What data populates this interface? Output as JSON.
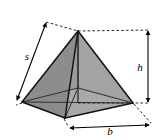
{
  "figure": {
    "name": "square-pyramid",
    "caption": "",
    "canvas": {
      "width": 165,
      "height": 140
    },
    "background_color": "#ffffff"
  },
  "labels": {
    "slant": "s",
    "height": "h",
    "base": "b"
  },
  "colors": {
    "face_left": "#8b8b8b",
    "face_front_left": "#959595",
    "face_front_right": "#a9a9a9",
    "face_right_sliver": "#9e9e9e",
    "outline": "#1a1a1a",
    "hidden_edge": "#3c3c3c",
    "guide_dashed": "#2a2a2a",
    "label_text": "#000000"
  },
  "geometry": {
    "apex": {
      "x": 78,
      "y": 31
    },
    "base_left": {
      "x": 22,
      "y": 102
    },
    "base_front": {
      "x": 65,
      "y": 118
    },
    "base_right": {
      "x": 133,
      "y": 103
    },
    "base_back": {
      "x": 78,
      "y": 88
    },
    "base_center": {
      "x": 78,
      "y": 103
    }
  },
  "dimensions": [
    {
      "id": "slant-dimension",
      "label": "s",
      "kind": "double-arrow",
      "from": {
        "x": 16,
        "y": 101
      },
      "to": {
        "x": 46,
        "y": 22
      },
      "label_pos": {
        "x": 25,
        "y": 58
      }
    },
    {
      "id": "height-dimension",
      "label": "h",
      "kind": "double-arrow",
      "from": {
        "x": 148,
        "y": 30
      },
      "to": {
        "x": 148,
        "y": 103
      },
      "label_pos": {
        "x": 141,
        "y": 70
      }
    },
    {
      "id": "base-dimension",
      "label": "b",
      "kind": "double-arrow",
      "from": {
        "x": 68,
        "y": 128
      },
      "to": {
        "x": 150,
        "y": 126
      },
      "label_pos": {
        "x": 108,
        "y": 133
      }
    }
  ],
  "guides": [
    {
      "id": "apex-to-slant-guide",
      "from": {
        "x": 46,
        "y": 22
      },
      "to": {
        "x": 78,
        "y": 31
      }
    },
    {
      "id": "apex-to-height-guide",
      "from": {
        "x": 78,
        "y": 31
      },
      "to": {
        "x": 150,
        "y": 30
      }
    },
    {
      "id": "base-to-height-guide",
      "from": {
        "x": 78,
        "y": 103
      },
      "to": {
        "x": 150,
        "y": 103
      }
    },
    {
      "id": "corner-to-base-guide",
      "from": {
        "x": 133,
        "y": 104
      },
      "to": {
        "x": 151,
        "y": 124
      }
    },
    {
      "id": "front-corner-to-base-guide",
      "from": {
        "x": 64,
        "y": 119
      },
      "to": {
        "x": 69,
        "y": 127
      }
    },
    {
      "id": "left-corner-to-slant-guide",
      "from": {
        "x": 22,
        "y": 103
      },
      "to": {
        "x": 17,
        "y": 104
      }
    }
  ]
}
